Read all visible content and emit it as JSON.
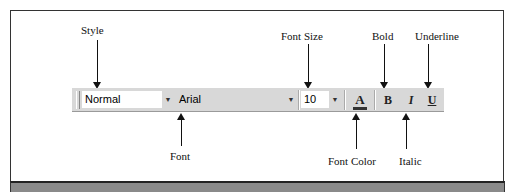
{
  "callouts": {
    "style": "Style",
    "font": "Font",
    "font_size": "Font Size",
    "font_color": "Font Color",
    "bold": "Bold",
    "italic": "Italic",
    "underline": "Underline"
  },
  "toolbar": {
    "style_value": "Normal",
    "font_value": "Arial",
    "size_value": "10",
    "dropdown_glyph": "▼",
    "font_color_glyph": "A",
    "bold_glyph": "B",
    "italic_glyph": "I",
    "underline_glyph": "U"
  },
  "colors": {
    "toolbar_bg": "#d8d8d8",
    "bottom_band": "#8a8a8a"
  }
}
